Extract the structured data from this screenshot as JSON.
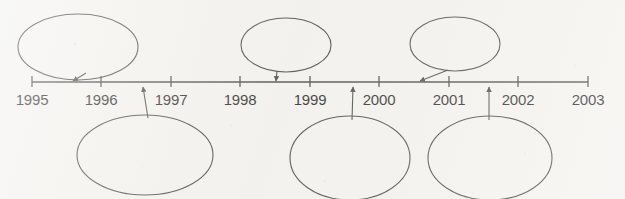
{
  "diagram": {
    "type": "timeline",
    "background_color": "#f3f2ee",
    "stroke_color": "#3a3734",
    "text_color": "#14110f",
    "axis": {
      "name": "year-axis",
      "start_year": 1995,
      "end_year": 2003,
      "x_start": 32,
      "x_end": 588,
      "y": 82,
      "tick_height": 11
    },
    "years": [
      {
        "label": "1995",
        "x": 32
      },
      {
        "label": "1996",
        "x": 101
      },
      {
        "label": "1997",
        "x": 171
      },
      {
        "label": "1998",
        "x": 240
      },
      {
        "label": "1999",
        "x": 310
      },
      {
        "label": "2000",
        "x": 379
      },
      {
        "label": "2001",
        "x": 449
      },
      {
        "label": "2002",
        "x": 518
      },
      {
        "label": "2003",
        "x": 588
      }
    ],
    "label_y": 98,
    "callouts": [
      {
        "id": "callout-1",
        "position": "above",
        "text": "",
        "cx": 78,
        "cy": 47,
        "rx": 60,
        "ry": 33,
        "anchor_x": 72,
        "anchor_y": 82,
        "leader_from_x": 86,
        "leader_from_y": 73,
        "arrow": "down-left"
      },
      {
        "id": "callout-2",
        "position": "above",
        "text": "",
        "cx": 286,
        "cy": 45,
        "rx": 45,
        "ry": 27,
        "anchor_x": 276,
        "anchor_y": 82,
        "leader_from_x": 277,
        "leader_from_y": 71,
        "arrow": "down"
      },
      {
        "id": "callout-3",
        "position": "above",
        "text": "",
        "cx": 455,
        "cy": 44,
        "rx": 45,
        "ry": 27,
        "anchor_x": 419,
        "anchor_y": 82,
        "leader_from_x": 448,
        "leader_from_y": 70,
        "arrow": "down-left"
      },
      {
        "id": "callout-4",
        "position": "below",
        "text": "",
        "cx": 145,
        "cy": 155,
        "rx": 68,
        "ry": 40,
        "anchor_x": 143,
        "anchor_y": 86,
        "leader_from_x": 148,
        "leader_from_y": 118,
        "arrow": "up"
      },
      {
        "id": "callout-5",
        "position": "below",
        "text": "",
        "cx": 350,
        "cy": 158,
        "rx": 60,
        "ry": 42,
        "anchor_x": 353,
        "anchor_y": 86,
        "leader_from_x": 352,
        "leader_from_y": 120,
        "arrow": "up"
      },
      {
        "id": "callout-6",
        "position": "below",
        "text": "",
        "cx": 490,
        "cy": 158,
        "rx": 62,
        "ry": 42,
        "anchor_x": 489,
        "anchor_y": 86,
        "leader_from_x": 489,
        "leader_from_y": 120,
        "arrow": "up"
      }
    ]
  }
}
